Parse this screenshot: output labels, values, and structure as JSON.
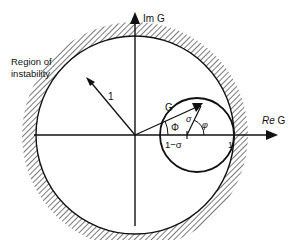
{
  "diagram": {
    "axes": {
      "imaginary_label": "Im G",
      "real_label_italic": "Re",
      "real_label_rest": " G"
    },
    "labels": {
      "region": [
        "Region of",
        "instability"
      ],
      "unit_radius": "1",
      "gain_vector": "G",
      "Phi": "Φ",
      "sigma": "σ",
      "phi": "φ",
      "one_minus_sigma": "1−σ",
      "one_tick": "1"
    },
    "colors": {
      "ink": "#111111",
      "background": "#ffffff"
    }
  }
}
